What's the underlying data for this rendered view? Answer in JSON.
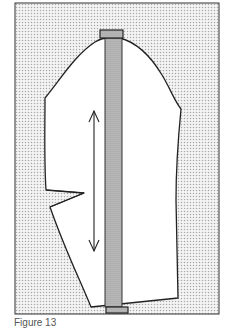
{
  "figure": {
    "caption": "Figure 13",
    "colors": {
      "background_dots": "#b8b8b8",
      "paper": "#ffffff",
      "outline": "#222222",
      "ruler_fill": "#9a9a9a"
    },
    "elements": {
      "pattern_piece": "sleeve-pattern",
      "dart": "elbow-dart",
      "grainline": "double-headed-arrow",
      "ruler": "vertical-ruler"
    }
  }
}
